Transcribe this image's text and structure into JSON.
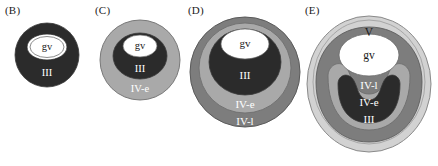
{
  "figure": {
    "caption_labels": [
      "(B)",
      "(C)",
      "(D)",
      "(E)"
    ],
    "layer_colors": {
      "gv": "#ffffff",
      "III": "#2b2b2b",
      "IV-e": "#a9a9a9",
      "IV-l": "#7d7d7d",
      "V": "#d2d2d2",
      "outline": "#4a4a4a"
    }
  },
  "panels": [
    {
      "id": "B",
      "label": "(B)",
      "layers": [
        {
          "name": "III",
          "label": "III",
          "color": "#2b2b2b",
          "text_color": "#ffffff"
        },
        {
          "name": "gv",
          "label": "gv",
          "color": "#ffffff",
          "text_color": "#1a1a1a"
        }
      ],
      "labels": {
        "gv": "gv",
        "III": "III"
      }
    },
    {
      "id": "C",
      "label": "(C)",
      "layers": [
        {
          "name": "IV-e",
          "label": "IV-e",
          "color": "#a9a9a9",
          "text_color": "#ffffff"
        },
        {
          "name": "III",
          "label": "III",
          "color": "#2b2b2b",
          "text_color": "#ffffff"
        },
        {
          "name": "gv",
          "label": "gv",
          "color": "#ffffff",
          "text_color": "#1a1a1a"
        }
      ],
      "labels": {
        "gv": "gv",
        "III": "III",
        "IV-e": "IV-e"
      }
    },
    {
      "id": "D",
      "label": "(D)",
      "layers": [
        {
          "name": "IV-l",
          "label": "IV-l",
          "color": "#7d7d7d",
          "text_color": "#ffffff"
        },
        {
          "name": "IV-e",
          "label": "IV-e",
          "color": "#a9a9a9",
          "text_color": "#ffffff"
        },
        {
          "name": "III",
          "label": "III",
          "color": "#2b2b2b",
          "text_color": "#ffffff"
        },
        {
          "name": "gv",
          "label": "gv",
          "color": "#ffffff",
          "text_color": "#1a1a1a"
        }
      ],
      "labels": {
        "gv": "gv",
        "III": "III",
        "IV-e": "IV-e",
        "IV-l": "IV-l"
      }
    },
    {
      "id": "E",
      "label": "(E)",
      "layers": [
        {
          "name": "V",
          "label": "V",
          "color": "#d2d2d2",
          "text_color": "#1a1a1a"
        },
        {
          "name": "IV-l",
          "label": "IV-l",
          "color": "#7d7d7d",
          "text_color": "#ffffff"
        },
        {
          "name": "IV-e",
          "label": "IV-e",
          "color": "#a9a9a9",
          "text_color": "#ffffff"
        },
        {
          "name": "III",
          "label": "III",
          "color": "#2b2b2b",
          "text_color": "#ffffff"
        },
        {
          "name": "gv",
          "label": "gv",
          "color": "#ffffff",
          "text_color": "#1a1a1a"
        }
      ],
      "labels": {
        "gv": "gv",
        "III": "III",
        "IV-e": "IV-e",
        "IV-l": "IV-l",
        "V": "V"
      }
    }
  ]
}
